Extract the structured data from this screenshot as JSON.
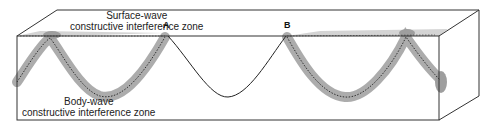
{
  "labels": {
    "surface_wave_line1": "Surface-wave",
    "surface_wave_line2": "constructive interference zone",
    "body_wave_line1": "Body-wave",
    "body_wave_line2": "constructive interference zone",
    "point_a": "A",
    "point_b": "B"
  },
  "colors": {
    "outline": "#333333",
    "zone_fill": "#9a9a9a",
    "surface_fill": "#c8c8c8",
    "background": "#ffffff"
  }
}
